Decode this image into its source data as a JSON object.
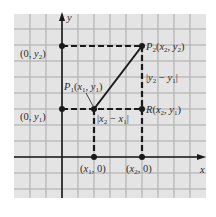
{
  "colors": {
    "background": "#e4e4e4",
    "grid": "#a9a9a9",
    "axis": "#1a1a1a",
    "dashed": "#1a1a1a",
    "segment": "#1a1a1a",
    "text": "#2a2a2a"
  },
  "axes": {
    "x_label": "x",
    "y_label": "y"
  },
  "points": {
    "p1": {
      "name": "P",
      "sub": "1",
      "coords": "(x1, y1)"
    },
    "p2": {
      "name": "P",
      "sub": "2",
      "coords": "(x2, y2)"
    },
    "r": {
      "name": "R",
      "coords": "(x2, y1)"
    }
  },
  "labels": {
    "y2_axis": "(0, y2)",
    "y1_axis": "(0, y1)",
    "x1_axis": "(x1, 0)",
    "x2_axis": "(x2, 0)",
    "dy": "|y2 − y1|",
    "dx": "|x2 − x1|"
  }
}
